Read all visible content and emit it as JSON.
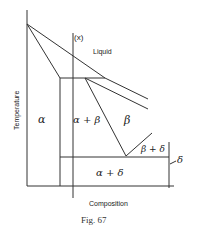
{
  "figure": {
    "caption": "Fig. 67",
    "x_axis_label": "Composition",
    "y_axis_label": "Temperature",
    "marker_label": "(x)",
    "regions": {
      "liquid": "Liquid",
      "alpha": "α",
      "alpha_beta": "α + β",
      "beta": "β",
      "beta_delta": "β + δ",
      "alpha_delta": "α + δ",
      "delta": "δ"
    }
  }
}
